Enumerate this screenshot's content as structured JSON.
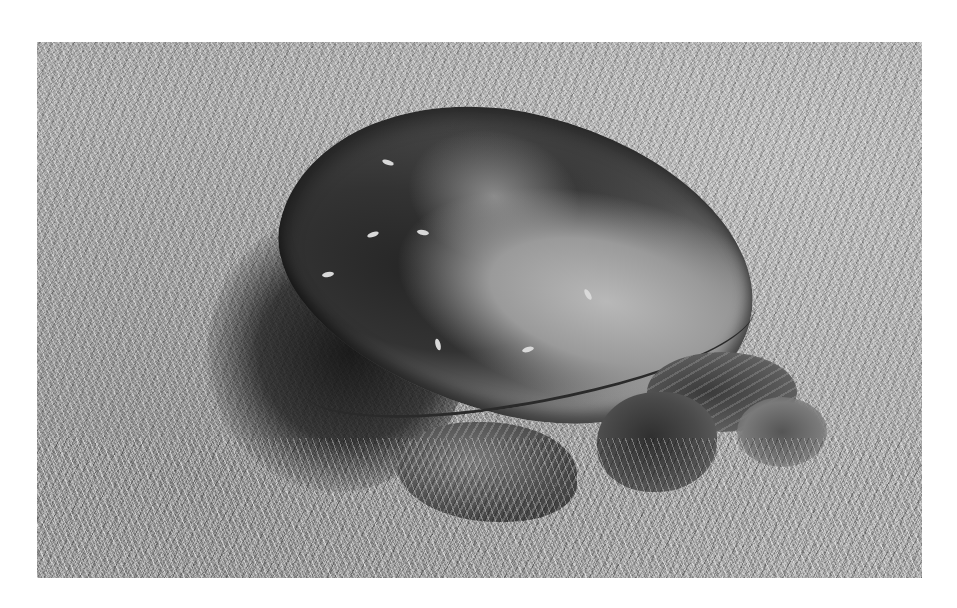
{
  "image": {
    "subject": "snapping turtle resting on grass",
    "style": "grayscale photograph",
    "background": "grass lawn",
    "frame_color": "#ffffff"
  },
  "palette": {
    "grass_mid": "#a9a9a9",
    "shell_dark": "#2b2b2b",
    "shell_light": "#b8b8b8",
    "shadow": "#1e1e1e"
  }
}
